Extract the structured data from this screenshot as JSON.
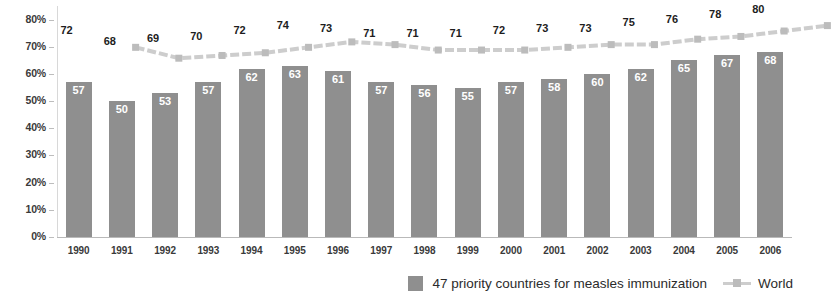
{
  "chart_data": {
    "type": "bar",
    "title": "",
    "subtitle": "",
    "xlabel": "",
    "ylabel": "",
    "ylim": [
      0,
      85
    ],
    "grid": false,
    "legend_position": "bottom-right",
    "categories": [
      "1990",
      "1991",
      "1992",
      "1993",
      "1994",
      "1995",
      "1996",
      "1997",
      "1998",
      "1999",
      "2000",
      "2001",
      "2002",
      "2003",
      "2004",
      "2005",
      "2006"
    ],
    "y_tick_labels": [
      "0%",
      "10%",
      "20%",
      "30%",
      "40%",
      "50%",
      "60%",
      "70%",
      "80%"
    ],
    "y_ticks": [
      0,
      10,
      20,
      30,
      40,
      50,
      60,
      70,
      80
    ],
    "series": [
      {
        "name": "47 priority countries for measles immunization",
        "type": "bar",
        "color": "#8f8f8f",
        "values": [
          57,
          50,
          53,
          57,
          62,
          63,
          61,
          57,
          56,
          55,
          57,
          58,
          60,
          62,
          65,
          67,
          68
        ]
      },
      {
        "name": "World",
        "type": "line",
        "color": "#cdcdcd",
        "values": [
          72,
          68,
          69,
          70,
          72,
          74,
          73,
          71,
          71,
          71,
          72,
          73,
          73,
          75,
          76,
          78,
          80
        ]
      }
    ]
  },
  "legend": {
    "items": [
      {
        "label": "47 priority countries for measles immunization",
        "marker": "square-swatch"
      },
      {
        "label": "World",
        "marker": "line-with-square-marker"
      }
    ]
  },
  "colors": {
    "bar": "#8f8f8f",
    "line": "#cdcdcd",
    "line_marker": "#bcbcbc",
    "axis": "#b9b9b9",
    "bar_label_text": "#ffffff",
    "line_label_text": "#1d1d1d",
    "background": "#ffffff"
  }
}
